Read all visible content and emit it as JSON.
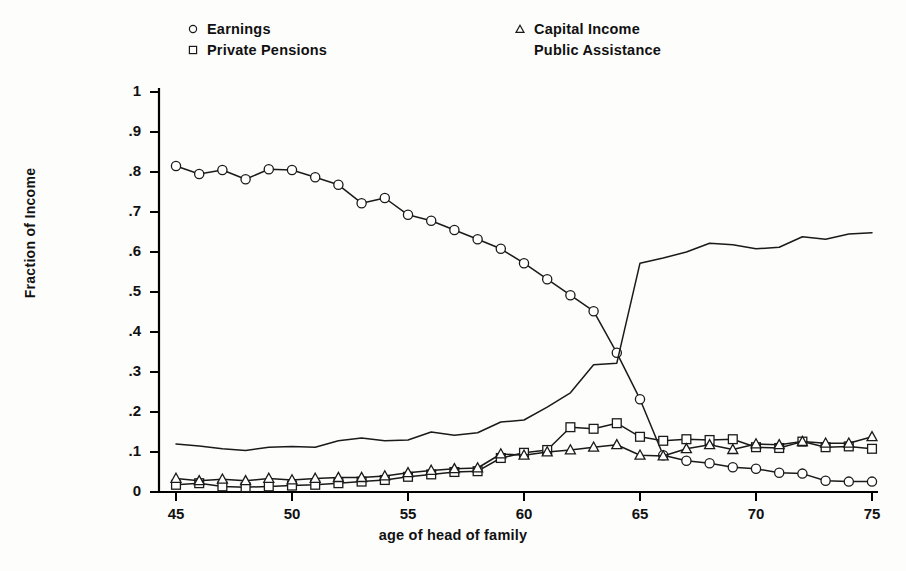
{
  "chart_data": {
    "type": "line",
    "title": "",
    "xlabel": "age of head of family",
    "ylabel": "Fraction of Income",
    "xlim": [
      44,
      76
    ],
    "ylim": [
      0,
      1
    ],
    "xticks": [
      45,
      50,
      55,
      60,
      65,
      70,
      75
    ],
    "xtick_labels": [
      "45",
      "50",
      "55",
      "60",
      "65",
      "70",
      "75"
    ],
    "yticks": [
      0,
      0.1,
      0.2,
      0.3,
      0.4,
      0.5,
      0.6,
      0.7,
      0.8,
      0.9,
      1
    ],
    "ytick_labels": [
      "0",
      ".1",
      ".2",
      ".3",
      ".4",
      ".5",
      ".6",
      ".7",
      ".8",
      ".9",
      "1"
    ],
    "grid": false,
    "legend_position": "above-plot",
    "x": [
      45,
      46,
      47,
      48,
      49,
      50,
      51,
      52,
      53,
      54,
      55,
      56,
      57,
      58,
      59,
      60,
      61,
      62,
      63,
      64,
      65,
      66,
      67,
      68,
      69,
      70,
      71,
      72,
      73,
      74,
      75
    ],
    "series": [
      {
        "name": "Earnings",
        "marker": "circle",
        "values": [
          0.815,
          0.795,
          0.805,
          0.782,
          0.807,
          0.805,
          0.787,
          0.768,
          0.722,
          0.735,
          0.693,
          0.678,
          0.655,
          0.632,
          0.608,
          0.572,
          0.532,
          0.492,
          0.452,
          0.348,
          0.232,
          0.092,
          0.078,
          0.072,
          0.062,
          0.058,
          0.048,
          0.046,
          0.028,
          0.026,
          0.026
        ]
      },
      {
        "name": "Private Pensions",
        "marker": "square",
        "values": [
          0.018,
          0.022,
          0.014,
          0.012,
          0.014,
          0.016,
          0.018,
          0.022,
          0.026,
          0.03,
          0.038,
          0.044,
          0.05,
          0.052,
          0.085,
          0.098,
          0.105,
          0.162,
          0.158,
          0.172,
          0.138,
          0.128,
          0.132,
          0.13,
          0.132,
          0.112,
          0.11,
          0.126,
          0.112,
          0.114,
          0.108
        ]
      },
      {
        "name": "Capital Income",
        "marker": "triangle",
        "values": [
          0.034,
          0.028,
          0.032,
          0.028,
          0.034,
          0.03,
          0.034,
          0.036,
          0.036,
          0.04,
          0.048,
          0.054,
          0.058,
          0.06,
          0.095,
          0.092,
          0.1,
          0.105,
          0.112,
          0.118,
          0.092,
          0.09,
          0.108,
          0.118,
          0.106,
          0.12,
          0.118,
          0.126,
          0.122,
          0.122,
          0.138
        ]
      },
      {
        "name": "Public Assistance",
        "marker": "none",
        "values": [
          0.12,
          0.115,
          0.108,
          0.104,
          0.112,
          0.114,
          0.112,
          0.128,
          0.135,
          0.128,
          0.13,
          0.15,
          0.142,
          0.148,
          0.175,
          0.18,
          0.212,
          0.248,
          0.318,
          0.322,
          0.572,
          0.585,
          0.6,
          0.622,
          0.618,
          0.608,
          0.612,
          0.638,
          0.632,
          0.645,
          0.648
        ]
      }
    ]
  },
  "legend": {
    "left_entries": [
      {
        "label": "Earnings",
        "marker": "circle-marker"
      },
      {
        "label": "Private Pensions",
        "marker": "square-marker"
      }
    ],
    "right_entries": [
      {
        "label": "Capital Income",
        "marker": "triangle-marker"
      },
      {
        "label": "Public Assistance",
        "marker": "none-marker"
      }
    ]
  },
  "style": {
    "line_color": "#1a1a1a",
    "axis_color": "#000000",
    "background": "#fdfdfc"
  }
}
